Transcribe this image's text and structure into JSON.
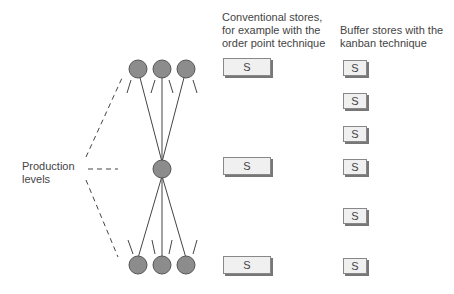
{
  "headers": {
    "conventional": "Conventional stores,\nfor example with the\norder point technique",
    "buffer": "Buffer stores with the\nkanban technique"
  },
  "production_label": "Production\nlevels",
  "store_label": "S",
  "conventional_stores": [
    {
      "label": "S",
      "x": 223,
      "y": 58
    },
    {
      "label": "S",
      "x": 223,
      "y": 157
    },
    {
      "label": "S",
      "x": 223,
      "y": 256
    }
  ],
  "buffer_stores": [
    {
      "label": "S",
      "x": 343,
      "y": 60
    },
    {
      "label": "S",
      "x": 343,
      "y": 93
    },
    {
      "label": "S",
      "x": 343,
      "y": 126
    },
    {
      "label": "S",
      "x": 343,
      "y": 159
    },
    {
      "label": "S",
      "x": 343,
      "y": 208
    },
    {
      "label": "S",
      "x": 343,
      "y": 258
    }
  ],
  "colors": {
    "node_fill": "#8c8c8c",
    "node_stroke": "#555555",
    "line": "#444444",
    "store_fill": "#f0f0f0"
  }
}
